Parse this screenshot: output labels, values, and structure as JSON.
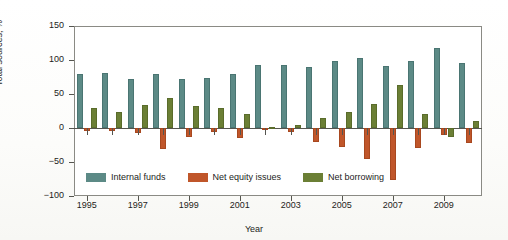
{
  "chart_data": {
    "type": "bar",
    "title": "",
    "xlabel": "Year",
    "ylabel": "Total sources, %",
    "ylim": [
      -100,
      150
    ],
    "yticks": [
      150,
      100,
      50,
      0,
      -50,
      -100
    ],
    "ytick_labels": [
      "150",
      "100",
      "50",
      "0",
      "−50",
      "−100"
    ],
    "grid": false,
    "legend_position": "inside-bottom-left",
    "categories": [
      1995,
      1996,
      1997,
      1998,
      1999,
      2000,
      2001,
      2002,
      2003,
      2004,
      2005,
      2006,
      2007,
      2008,
      2009,
      2010
    ],
    "xtick_labels": [
      "1995",
      "1997",
      "1999",
      "2001",
      "2003",
      "2005",
      "2007",
      "2009"
    ],
    "xticks": [
      1995,
      1997,
      1999,
      2001,
      2003,
      2005,
      2007,
      2009
    ],
    "series": [
      {
        "name": "Internal funds",
        "color": "#5c8a86",
        "values": [
          79,
          81,
          72,
          79,
          72,
          74,
          79,
          93,
          93,
          89,
          98,
          103,
          91,
          98,
          118,
          95
        ]
      },
      {
        "name": "Net equity issues",
        "color": "#c0562a",
        "values": [
          -5,
          -5,
          -7,
          -31,
          -13,
          -6,
          -14,
          -3,
          -6,
          -20,
          -28,
          -45,
          -77,
          -30,
          -10,
          -22
        ]
      },
      {
        "name": "Net borrowing",
        "color": "#6b7f35",
        "values": [
          29,
          23,
          34,
          44,
          33,
          29,
          21,
          2,
          5,
          14,
          24,
          35,
          63,
          21,
          -13,
          11
        ]
      }
    ]
  },
  "legend": {
    "items": [
      {
        "label": "Internal funds",
        "color": "#5c8a86"
      },
      {
        "label": "Net equity issues",
        "color": "#c0562a"
      },
      {
        "label": "Net borrowing",
        "color": "#6b7f35"
      }
    ]
  }
}
